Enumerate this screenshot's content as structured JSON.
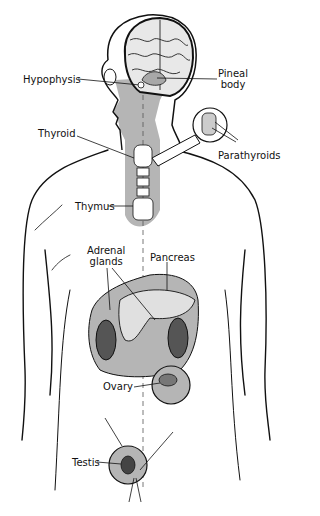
{
  "diagram": {
    "colors": {
      "ink": "#111111",
      "shade": "#b5b5b5",
      "background": "#ffffff"
    },
    "labels": {
      "hypophysis": "Hypophysis",
      "pineal_line1": "Pineal",
      "pineal_line2": "body",
      "thyroid": "Thyroid",
      "parathyroids": "Parathyroids",
      "thymus": "Thymus",
      "adrenal_line1": "Adrenal",
      "adrenal_line2": "glands",
      "pancreas": "Pancreas",
      "ovary": "Ovary",
      "testis": "Testis"
    }
  }
}
